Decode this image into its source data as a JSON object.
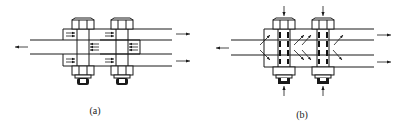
{
  "figure": {
    "panels": [
      {
        "id": "a",
        "caption": "(a)",
        "bolts": 2,
        "description": "Double-shear bolted lap joint, friction-type: shear arrows on plate contact faces"
      },
      {
        "id": "b",
        "caption": "(b)",
        "bolts": 2,
        "description": "Double-shear bolted lap joint, bearing-type: clamping arrows on bolts and oblique force lines in plates"
      }
    ],
    "colors": {
      "line": "#1a1a1a",
      "background": "#ffffff"
    }
  }
}
